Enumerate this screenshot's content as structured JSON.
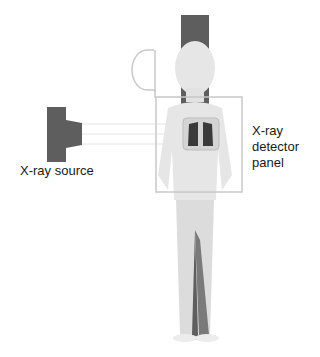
{
  "labels": {
    "source": "X-ray source",
    "detector_line1": "X-ray",
    "detector_line2": "detector",
    "detector_line3": "panel"
  },
  "colors": {
    "background": "#ffffff",
    "equipment": "#5e5e5e",
    "outline": "#c8c8c8",
    "figure": "#e6e6e6",
    "figure_shadow": "#cfcfcf",
    "lungs": "#3a3a3a",
    "text": "#1a1a1a"
  }
}
